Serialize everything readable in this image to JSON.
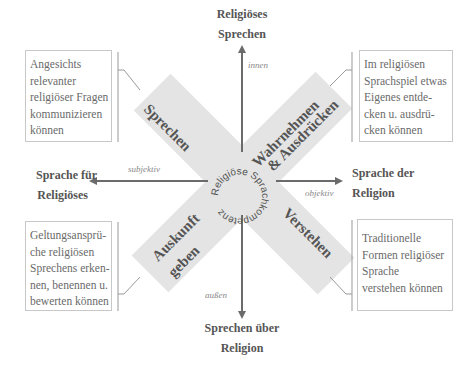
{
  "title": "Religiöse Sprachkompetenz",
  "center_label": "Religiöse Sprachkompetenz",
  "axes": {
    "top": {
      "line1": "Religiöses",
      "line2": "Sprechen",
      "pole": "innen"
    },
    "bottom": {
      "line1": "Sprechen über",
      "line2": "Religion",
      "pole": "außen"
    },
    "left": {
      "line1": "Sprache für",
      "line2": "Religiöses",
      "pole": "subjektiv"
    },
    "right": {
      "line1": "Sprache der",
      "line2": "Religion",
      "pole": "objektiv"
    }
  },
  "dimensions": [
    {
      "id": "sprechen",
      "label": "Sprechen",
      "description": [
        "Angesichts",
        "relevanter",
        "religiöser Fragen",
        "kommunizieren",
        "können"
      ]
    },
    {
      "id": "wahrnehmen",
      "label_line1": "Wahrnehmen",
      "label_line2": "& Ausdrücken",
      "description": [
        "Im religiösen",
        "Sprachspiel etwas",
        "Eigenes entde-",
        "cken u. ausdrü-",
        "cken können"
      ]
    },
    {
      "id": "auskunft",
      "label_line1": "Auskunft",
      "label_line2": "geben",
      "description": [
        "Geltungsansprü-",
        "che religiösen",
        "Sprechens erken-",
        "nen, benennen u.",
        "bewerten können"
      ]
    },
    {
      "id": "verstehen",
      "label": "Verstehen",
      "description": [
        "Traditionelle",
        "Formen religiöser",
        "Sprache",
        "verstehen können"
      ]
    }
  ],
  "colors": {
    "band": "#e4e4e4",
    "arrow": "#6b6b6b",
    "text": "#555555",
    "box_border": "#c8c8c8"
  }
}
